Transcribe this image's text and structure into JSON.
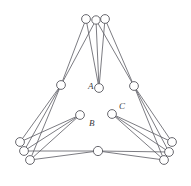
{
  "figure": {
    "background_color": "#ffffff",
    "edge_color": "#5a5a62",
    "node_stroke_color": "#58585f",
    "node_fill_color": "#ffffff",
    "label_color": "#3b3b40",
    "width": 191,
    "height": 186
  },
  "chart_data": {
    "type": "scatter",
    "title": "",
    "xlabel": "",
    "ylabel": "",
    "grid": false,
    "legend": "none",
    "xlim": [
      0,
      191
    ],
    "ylim": [
      0,
      186
    ],
    "nodes": [
      {
        "id": "t1",
        "label": "",
        "x": 86,
        "y": 19,
        "r": 4.4
      },
      {
        "id": "t2",
        "label": "",
        "x": 96,
        "y": 20,
        "r": 4.2
      },
      {
        "id": "t3",
        "label": "",
        "x": 105,
        "y": 19,
        "r": 4.4
      },
      {
        "id": "ml",
        "label": "",
        "x": 61,
        "y": 85,
        "r": 4.4
      },
      {
        "id": "mr",
        "label": "",
        "x": 134,
        "y": 86,
        "r": 4.4
      },
      {
        "id": "a",
        "label": "A",
        "x": 99,
        "y": 88,
        "r": 4.4
      },
      {
        "id": "b",
        "label": "B",
        "x": 80,
        "y": 115,
        "r": 4.4
      },
      {
        "id": "c",
        "label": "C",
        "x": 112,
        "y": 114,
        "r": 4.4
      },
      {
        "id": "bl1",
        "label": "",
        "x": 20,
        "y": 142,
        "r": 4.4
      },
      {
        "id": "bl2",
        "label": "",
        "x": 24,
        "y": 151,
        "r": 4.4
      },
      {
        "id": "bl3",
        "label": "",
        "x": 30,
        "y": 160,
        "r": 4.4
      },
      {
        "id": "bc",
        "label": "",
        "x": 98,
        "y": 151,
        "r": 4.6
      },
      {
        "id": "br1",
        "label": "",
        "x": 172,
        "y": 142,
        "r": 4.4
      },
      {
        "id": "br2",
        "label": "",
        "x": 169,
        "y": 152,
        "r": 4.4
      },
      {
        "id": "br3",
        "label": "",
        "x": 164,
        "y": 160,
        "r": 4.4
      }
    ],
    "labels": [
      {
        "text": "A",
        "x": 88,
        "y": 89
      },
      {
        "text": "B",
        "x": 89,
        "y": 126
      },
      {
        "text": "C",
        "x": 119,
        "y": 109
      }
    ],
    "edges": [
      {
        "from": "t1",
        "to": "ml"
      },
      {
        "from": "t2",
        "to": "ml"
      },
      {
        "from": "t1",
        "to": "a"
      },
      {
        "from": "t2",
        "to": "a"
      },
      {
        "from": "t3",
        "to": "a"
      },
      {
        "from": "t2",
        "to": "mr"
      },
      {
        "from": "t3",
        "to": "mr"
      },
      {
        "from": "ml",
        "to": "bl1"
      },
      {
        "from": "ml",
        "to": "bl2"
      },
      {
        "from": "ml",
        "to": "bl3"
      },
      {
        "from": "mr",
        "to": "br1"
      },
      {
        "from": "mr",
        "to": "br2"
      },
      {
        "from": "mr",
        "to": "br3"
      },
      {
        "from": "b",
        "to": "bl1"
      },
      {
        "from": "b",
        "to": "bl2"
      },
      {
        "from": "b",
        "to": "bl3"
      },
      {
        "from": "c",
        "to": "br1"
      },
      {
        "from": "c",
        "to": "br2"
      },
      {
        "from": "c",
        "to": "br3"
      },
      {
        "from": "bl2",
        "to": "bc"
      },
      {
        "from": "bl3",
        "to": "bc"
      },
      {
        "from": "bc",
        "to": "br2"
      },
      {
        "from": "bc",
        "to": "br3"
      }
    ]
  }
}
